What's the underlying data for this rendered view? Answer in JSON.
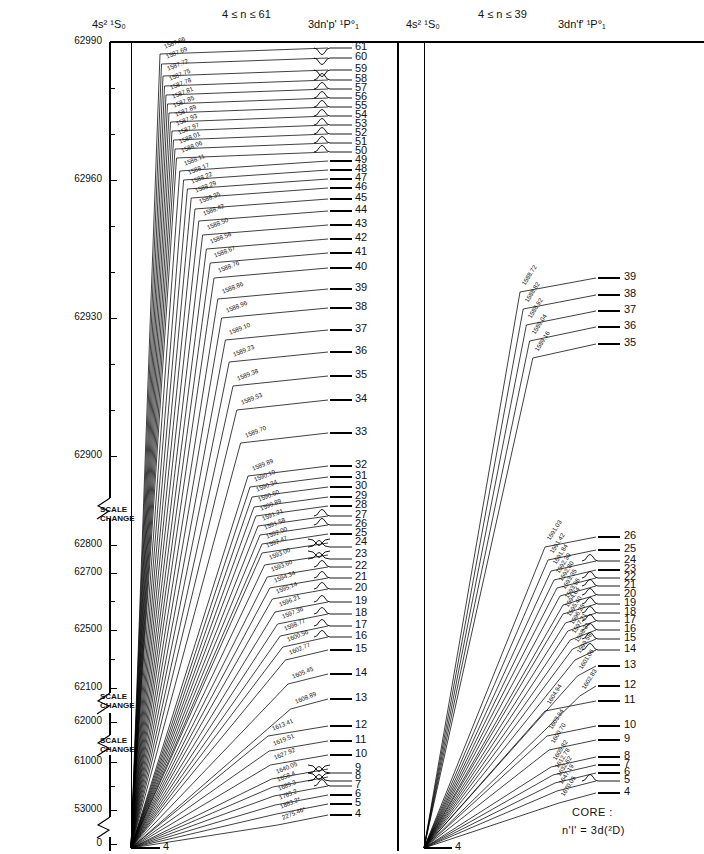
{
  "axis": {
    "title": "ENERGY (cm⁻¹)",
    "ticks_labeled": [
      "62990",
      "62960",
      "62930",
      "62900",
      "62800",
      "62700",
      "62500",
      "62100",
      "62000",
      "61000",
      "53000",
      "0"
    ],
    "scale_change_label_line1": "SCALE",
    "scale_change_label_line2": "CHANGE",
    "scale_change_count": 3
  },
  "panels": [
    {
      "id": "left",
      "left_header": "4s² ¹S₀",
      "range_header": "4 ≤ n ≤ 61",
      "right_header": "3dn'p' ¹P°₁",
      "ground_label": "4",
      "levels": [
        "61",
        "60",
        "59",
        "58",
        "57",
        "56",
        "55",
        "54",
        "53",
        "52",
        "51",
        "50",
        "49",
        "48",
        "47",
        "46",
        "45",
        "44",
        "43",
        "42",
        "41",
        "40",
        "39",
        "38",
        "37",
        "36",
        "35",
        "34",
        "33",
        "32",
        "31",
        "30",
        "29",
        "28",
        "27",
        "26",
        "25",
        "24",
        "23",
        "22",
        "21",
        "20",
        "19",
        "18",
        "17",
        "16",
        "15",
        "14",
        "13",
        "12",
        "11",
        "10",
        "9",
        "8",
        "7",
        "6",
        "5",
        "4"
      ],
      "wavelengths": [
        "1587.66",
        "1587.69",
        "1587.72",
        "1587.75",
        "1587.78",
        "1587.81",
        "1587.85",
        "1587.89",
        "1587.93",
        "1587.97",
        "1588.01",
        "1588.06",
        "1588.11",
        "1588.17",
        "1588.22",
        "1588.29",
        "1588.35",
        "1588.42",
        "1588.50",
        "1588.58",
        "1588.67",
        "1588.76",
        "1588.86",
        "1588.96",
        "1589.10",
        "1589.23",
        "1589.38",
        "1589.53",
        "1589.70",
        "1589.89",
        "1590.10",
        "1590.34",
        "1590.60",
        "1590.89",
        "1591.21",
        "1591.58",
        "1592.00",
        "1592.47",
        "1593.00",
        "1593.60",
        "1594.34",
        "1595.14",
        "1596.21",
        "1597.36",
        "1598.77",
        "1600.56",
        "1602.77",
        "1605.45",
        "1608.89",
        "1613.41",
        "1619.51",
        "1627.92",
        "1640.05",
        "1658.4",
        "1689.3",
        "1765.2",
        "1883.2*",
        "2275.46*"
      ]
    },
    {
      "id": "right",
      "left_header": "4s² ¹S₀",
      "range_header": "4 ≤ n ≤ 39",
      "right_header": "3dn'f' ¹P°₁",
      "ground_label": "4",
      "levels": [
        "39",
        "38",
        "37",
        "36",
        "35",
        "26",
        "25",
        "24",
        "23",
        "22",
        "21",
        "20",
        "19",
        "18",
        "17",
        "16",
        "15",
        "14",
        "13",
        "12",
        "11",
        "10",
        "9",
        "8",
        "7",
        "6",
        "5",
        "4"
      ],
      "wavelengths": [
        "1588.72",
        "1588.82",
        "1588.92",
        "1589.04",
        "1589.16",
        "1591.03",
        "1591.42",
        "1591.84",
        "1592.30",
        "1592.80",
        "1593.35",
        "1593.96",
        "1594.64",
        "1595.40",
        "1596.25",
        "1597.21",
        "1598.31",
        "1599.58",
        "1601.06",
        "1602.83",
        "1604.94",
        "1603.94",
        "1600.70",
        "1605.82",
        "1612.78",
        "1632.62",
        "1647.19",
        "1670.05",
        "1709.23",
        "1786.28"
      ]
    }
  ],
  "core_note": {
    "line1": "CORE :",
    "line2": "n'l' = 3d(²D)"
  },
  "chart_data": {
    "type": "line",
    "ylabel": "ENERGY (cm⁻¹)",
    "ylim": [
      0,
      62990
    ],
    "grid": false,
    "legend": "none",
    "broken_axis_segments": [
      "62990–62900 linear",
      "62900–62100 compressed after SCALE CHANGE",
      "62100–61000 after SCALE CHANGE",
      "61000–0 after SCALE CHANGE"
    ],
    "series": [
      {
        "name": "3dn'p' ¹P°₁ (4 ≤ n ≤ 61)",
        "panel": "left",
        "ground_state": "4s² ¹S₀",
        "n_values": [
          61,
          60,
          59,
          58,
          57,
          56,
          55,
          54,
          53,
          52,
          51,
          50,
          49,
          48,
          47,
          46,
          45,
          44,
          43,
          42,
          41,
          40,
          39,
          38,
          37,
          36,
          35,
          34,
          33,
          32,
          31,
          30,
          29,
          28,
          27,
          26,
          25,
          24,
          23,
          22,
          21,
          20,
          19,
          18,
          17,
          16,
          15,
          14,
          13,
          12,
          11,
          10,
          9,
          8,
          7,
          6,
          5,
          4
        ],
        "transition_wavelengths_angstrom": [
          1587.66,
          1587.69,
          1587.72,
          1587.75,
          1587.78,
          1587.81,
          1587.85,
          1587.89,
          1587.93,
          1587.97,
          1588.01,
          1588.06,
          1588.11,
          1588.17,
          1588.22,
          1588.29,
          1588.35,
          1588.42,
          1588.5,
          1588.58,
          1588.67,
          1588.76,
          1588.86,
          1588.96,
          1589.1,
          1589.23,
          1589.38,
          1589.53,
          1589.7,
          1589.89,
          1590.1,
          1590.34,
          1590.6,
          1590.89,
          1591.21,
          1591.58,
          1592.0,
          1592.47,
          1593.0,
          1593.6,
          1594.34,
          1595.14,
          1596.21,
          1597.36,
          1598.77,
          1600.56,
          1602.77,
          1605.45,
          1608.89,
          1613.41,
          1619.51,
          1627.92,
          1640.05,
          1658.4,
          1689.3,
          1765.2,
          1883.2,
          2275.46
        ]
      },
      {
        "name": "3dn'f' ¹P°₁ (4 ≤ n ≤ 39)",
        "panel": "right",
        "ground_state": "4s² ¹S₀",
        "n_values": [
          39,
          38,
          37,
          36,
          35,
          26,
          25,
          24,
          23,
          22,
          21,
          20,
          19,
          18,
          17,
          16,
          15,
          14,
          13,
          12,
          11,
          10,
          9,
          8,
          7,
          6,
          5,
          4
        ],
        "transition_wavelengths_angstrom": [
          1588.72,
          1588.82,
          1588.92,
          1589.04,
          1589.16,
          1591.03,
          1591.42,
          1591.84,
          1592.3,
          1592.8,
          1593.35,
          1593.96,
          1594.64,
          1595.4,
          1596.25,
          1597.21,
          1598.31,
          1599.58,
          1601.06,
          1602.83,
          1604.94,
          1603.94,
          1600.7,
          1605.82,
          1612.78,
          1632.62,
          1647.19,
          1670.05
        ]
      }
    ]
  }
}
